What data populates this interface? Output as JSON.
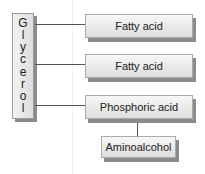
{
  "glycerol": {
    "label": "Glycerol",
    "letters": [
      "G",
      "l",
      "y",
      "c",
      "e",
      "r",
      "o",
      "l"
    ]
  },
  "boxes": [
    {
      "label": "Fatty acid"
    },
    {
      "label": "Fatty acid"
    },
    {
      "label": "Phosphoric acid"
    },
    {
      "label": "Aminoalcohol"
    }
  ]
}
